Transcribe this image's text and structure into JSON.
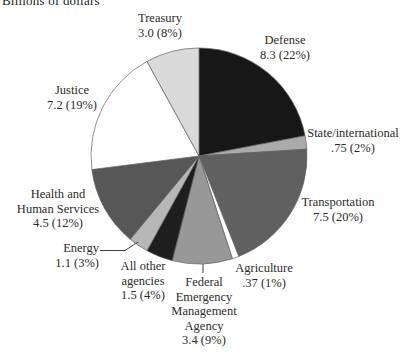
{
  "note": "Billions of dollars",
  "chart_data": {
    "type": "pie",
    "title": "Billions of dollars",
    "units": "billions of dollars",
    "direction": "clockwise",
    "start_angle": "12 o'clock",
    "legend": "none (direct slice labels)",
    "slices": [
      {
        "id": "defense",
        "label": "Defense",
        "value": 8.3,
        "percent": 22,
        "value_text": "8.3 (22%)",
        "color": "#171717"
      },
      {
        "id": "state-international",
        "label": "State/international",
        "value": 0.75,
        "percent": 2,
        "value_text": ".75 (2%)",
        "color": "#ababab"
      },
      {
        "id": "transportation",
        "label": "Transportation",
        "value": 7.5,
        "percent": 20,
        "value_text": "7.5 (20%)",
        "color": "#606060"
      },
      {
        "id": "agriculture",
        "label": "Agriculture",
        "value": 0.37,
        "percent": 1,
        "value_text": ".37 (1%)",
        "color": "#ffffff"
      },
      {
        "id": "fema",
        "label": "Federal Emergency Management Agency",
        "value": 3.4,
        "percent": 9,
        "value_text": "3.4 (9%)",
        "color": "#989898"
      },
      {
        "id": "all-other-agencies",
        "label": "All other agencies",
        "value": 1.5,
        "percent": 4,
        "value_text": "1.5 (4%)",
        "color": "#1e1e1e"
      },
      {
        "id": "energy",
        "label": "Energy",
        "value": 1.1,
        "percent": 3,
        "value_text": "1.1 (3%)",
        "color": "#b7b7b7"
      },
      {
        "id": "health-human-services",
        "label": "Health and Human Services",
        "value": 4.5,
        "percent": 12,
        "value_text": "4.5 (12%)",
        "color": "#575757"
      },
      {
        "id": "justice",
        "label": "Justice",
        "value": 7.2,
        "percent": 19,
        "value_text": "7.2 (19%)",
        "color": "#ffffff"
      },
      {
        "id": "treasury",
        "label": "Treasury",
        "value": 3.0,
        "percent": 8,
        "value_text": "3.0 (8%)",
        "color": "#dadada"
      }
    ]
  },
  "labels": {
    "treasury": {
      "line1": "Treasury",
      "line2": "3.0 (8%)"
    },
    "defense": {
      "line1": "Defense",
      "line2": "8.3 (22%)"
    },
    "state": {
      "line1": "State/international",
      "line2": ".75 (2%)"
    },
    "transportation": {
      "line1": "Transportation",
      "line2": "7.5 (20%)"
    },
    "agriculture": {
      "line1": "Agriculture",
      "line2": ".37 (1%)"
    },
    "fema": {
      "line1": "Federal",
      "line2": "Emergency",
      "line3": "Management",
      "line4": "Agency",
      "line5": "3.4 (9%)"
    },
    "all_other": {
      "line1": "All other",
      "line2": "agencies",
      "line3": "1.5 (4%)"
    },
    "energy": {
      "line1": "Energy",
      "line2": "1.1 (3%)"
    },
    "hhs": {
      "line1": "Health and",
      "line2": "Human Services",
      "line3": "4.5 (12%)"
    },
    "justice": {
      "line1": "Justice",
      "line2": "7.2 (19%)"
    }
  }
}
